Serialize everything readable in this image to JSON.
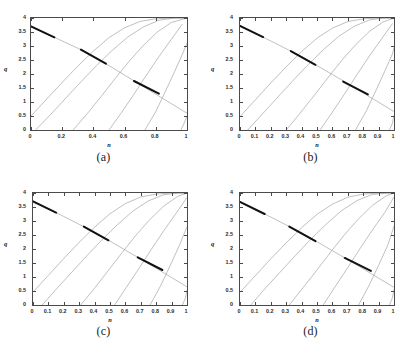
{
  "figure": {
    "background": "#ffffff",
    "panels": [
      {
        "caption": "(a)",
        "xlabel": "n",
        "ylabel": "q",
        "xticks": [
          "0",
          "0.2",
          "0.4",
          "0.6",
          "0.8",
          "1"
        ],
        "xtickvals": [
          0,
          0.2,
          0.4,
          0.6,
          0.8,
          1
        ],
        "yticks": [
          "0",
          "0.5",
          "1",
          "1.5",
          "2",
          "2.5",
          "3",
          "3.5",
          "4"
        ],
        "ytickvals": [
          0,
          0.5,
          1,
          1.5,
          2,
          2.5,
          3,
          3.5,
          4
        ]
      },
      {
        "caption": "(b)",
        "xlabel": "n",
        "ylabel": "q",
        "xticks": [
          "0",
          "0.1",
          "0.2",
          "0.3",
          "0.4",
          "0.5",
          "0.6",
          "0.7",
          "0.8",
          "0.9",
          "1"
        ],
        "xtickvals": [
          0,
          0.1,
          0.2,
          0.3,
          0.4,
          0.5,
          0.6,
          0.7,
          0.8,
          0.9,
          1
        ],
        "yticks": [
          "0",
          "0.5",
          "1",
          "1.5",
          "2",
          "2.5",
          "3",
          "3.5",
          "4"
        ],
        "ytickvals": [
          0,
          0.5,
          1,
          1.5,
          2,
          2.5,
          3,
          3.5,
          4
        ]
      },
      {
        "caption": "(c)",
        "xlabel": "n",
        "ylabel": "q",
        "xticks": [
          "0",
          "0.1",
          "0.2",
          "0.3",
          "0.4",
          "0.5",
          "0.6",
          "0.7",
          "0.8",
          "0.9",
          "1"
        ],
        "xtickvals": [
          0,
          0.1,
          0.2,
          0.3,
          0.4,
          0.5,
          0.6,
          0.7,
          0.8,
          0.9,
          1
        ],
        "yticks": [
          "0",
          "0.5",
          "1",
          "1.5",
          "2",
          "2.5",
          "3",
          "3.5",
          "4"
        ],
        "ytickvals": [
          0,
          0.5,
          1,
          1.5,
          2,
          2.5,
          3,
          3.5,
          4
        ]
      },
      {
        "caption": "(d)",
        "xlabel": "n",
        "ylabel": "q",
        "xticks": [
          "0",
          "0.1",
          "0.2",
          "0.3",
          "0.4",
          "0.5",
          "0.6",
          "0.7",
          "0.8",
          "0.9",
          "1"
        ],
        "xtickvals": [
          0,
          0.1,
          0.2,
          0.3,
          0.4,
          0.5,
          0.6,
          0.7,
          0.8,
          0.9,
          1
        ],
        "yticks": [
          "0",
          "0.5",
          "1",
          "1.5",
          "2",
          "2.5",
          "3",
          "3.5",
          "4"
        ],
        "ytickvals": [
          0,
          0.5,
          1,
          1.5,
          2,
          2.5,
          3,
          3.5,
          4
        ]
      }
    ],
    "showthrough": [
      "",
      "",
      "",
      ""
    ]
  },
  "chart_data": [
    {
      "type": "line",
      "panel": "(a)",
      "title": "",
      "xlabel": "n",
      "ylabel": "q",
      "xlim": [
        0,
        1
      ],
      "ylim": [
        0,
        4
      ],
      "grid": false,
      "legend": "none",
      "line_color": "#8c8c8c",
      "highlight_color": "#111111",
      "series": [
        {
          "name": "descending-branch",
          "comment": "main falling curve from upper-left to lower-right",
          "x": [
            0.0,
            0.05,
            0.1,
            0.15,
            0.2,
            0.25,
            0.3,
            0.35,
            0.4,
            0.45,
            0.5,
            0.55,
            0.6,
            0.65,
            0.7,
            0.75,
            0.8,
            0.85,
            0.9,
            0.95,
            1.0
          ],
          "y": [
            3.7,
            3.57,
            3.44,
            3.31,
            3.18,
            3.05,
            2.92,
            2.78,
            2.63,
            2.47,
            2.3,
            2.13,
            1.96,
            1.79,
            1.62,
            1.45,
            1.28,
            1.11,
            0.94,
            0.77,
            0.6
          ]
        },
        {
          "name": "ascending-family-1",
          "x": [
            0.0,
            0.1,
            0.2,
            0.3,
            0.4,
            0.5,
            0.6,
            0.7,
            0.8,
            0.9,
            1.0
          ],
          "y": [
            0.5,
            1.1,
            1.7,
            2.28,
            2.82,
            3.3,
            3.65,
            3.88,
            3.97,
            4.0,
            4.0
          ]
        },
        {
          "name": "ascending-family-2",
          "x": [
            0.03,
            0.12,
            0.22,
            0.32,
            0.42,
            0.52,
            0.62,
            0.72,
            0.82,
            0.92,
            1.0
          ],
          "y": [
            0.0,
            0.52,
            1.12,
            1.72,
            2.3,
            2.84,
            3.32,
            3.68,
            3.92,
            4.0,
            4.0
          ]
        },
        {
          "name": "ascending-family-3",
          "x": [
            0.27,
            0.36,
            0.45,
            0.54,
            0.63,
            0.72,
            0.81,
            0.9,
            1.0
          ],
          "y": [
            0.0,
            0.58,
            1.2,
            1.84,
            2.46,
            3.02,
            3.5,
            3.84,
            4.0
          ]
        },
        {
          "name": "ascending-family-4",
          "x": [
            0.5,
            0.58,
            0.66,
            0.74,
            0.82,
            0.9,
            0.97
          ],
          "y": [
            0.0,
            0.62,
            1.28,
            1.96,
            2.62,
            3.24,
            3.78
          ]
        },
        {
          "name": "ascending-family-5",
          "x": [
            0.73,
            0.8,
            0.86,
            0.92,
            0.97,
            1.0
          ],
          "y": [
            0.0,
            0.66,
            1.36,
            2.08,
            2.7,
            3.1
          ]
        },
        {
          "name": "ascending-family-6",
          "x": [
            0.96,
            0.98,
            1.0
          ],
          "y": [
            0.0,
            0.22,
            0.5
          ]
        },
        {
          "name": "highlight-segment-1",
          "comment": "thick black segment near upper left",
          "x": [
            0.0,
            0.15
          ],
          "y": [
            3.7,
            3.31
          ]
        },
        {
          "name": "highlight-segment-2",
          "comment": "thick black segment near middle",
          "x": [
            0.32,
            0.48
          ],
          "y": [
            2.87,
            2.37
          ]
        },
        {
          "name": "highlight-segment-3",
          "comment": "thick black segment lower right",
          "x": [
            0.66,
            0.82
          ],
          "y": [
            1.75,
            1.3
          ]
        }
      ]
    },
    {
      "type": "line",
      "panel": "(b)",
      "title": "",
      "xlabel": "n",
      "ylabel": "q",
      "xlim": [
        0,
        1
      ],
      "ylim": [
        0,
        4
      ],
      "grid": false,
      "legend": "none",
      "line_color": "#8c8c8c",
      "highlight_color": "#111111",
      "series": [
        {
          "name": "descending-branch",
          "x": [
            0.0,
            0.1,
            0.2,
            0.3,
            0.4,
            0.5,
            0.6,
            0.7,
            0.8,
            0.9,
            1.0
          ],
          "y": [
            3.72,
            3.45,
            3.18,
            2.9,
            2.62,
            2.3,
            1.98,
            1.66,
            1.32,
            0.99,
            0.66
          ]
        },
        {
          "name": "ascending-family-1",
          "x": [
            0.0,
            0.1,
            0.2,
            0.3,
            0.4,
            0.5,
            0.6,
            0.7,
            0.8,
            0.9,
            1.0
          ],
          "y": [
            0.48,
            1.08,
            1.68,
            2.26,
            2.8,
            3.28,
            3.64,
            3.87,
            3.97,
            4.0,
            4.0
          ]
        },
        {
          "name": "ascending-family-2",
          "x": [
            0.05,
            0.14,
            0.24,
            0.34,
            0.44,
            0.54,
            0.64,
            0.74,
            0.84,
            0.94,
            1.0
          ],
          "y": [
            0.0,
            0.54,
            1.14,
            1.74,
            2.32,
            2.86,
            3.34,
            3.7,
            3.93,
            4.0,
            4.0
          ]
        },
        {
          "name": "ascending-family-3",
          "x": [
            0.3,
            0.39,
            0.48,
            0.57,
            0.66,
            0.75,
            0.84,
            0.93,
            1.0
          ],
          "y": [
            0.0,
            0.6,
            1.22,
            1.86,
            2.48,
            3.04,
            3.52,
            3.86,
            4.0
          ]
        },
        {
          "name": "ascending-family-4",
          "x": [
            0.52,
            0.6,
            0.68,
            0.76,
            0.84,
            0.92,
            0.99
          ],
          "y": [
            0.0,
            0.64,
            1.3,
            1.98,
            2.64,
            3.26,
            3.8
          ]
        },
        {
          "name": "ascending-family-5",
          "x": [
            0.75,
            0.82,
            0.88,
            0.94,
            0.99,
            1.0
          ],
          "y": [
            0.0,
            0.68,
            1.38,
            2.1,
            2.72,
            2.95
          ]
        },
        {
          "name": "ascending-family-6",
          "x": [
            0.97,
            0.99,
            1.0
          ],
          "y": [
            0.0,
            0.24,
            0.52
          ]
        },
        {
          "name": "highlight-segment-1",
          "x": [
            0.0,
            0.15
          ],
          "y": [
            3.72,
            3.32
          ]
        },
        {
          "name": "highlight-segment-2",
          "x": [
            0.33,
            0.49
          ],
          "y": [
            2.82,
            2.33
          ]
        },
        {
          "name": "highlight-segment-3",
          "x": [
            0.67,
            0.83
          ],
          "y": [
            1.73,
            1.27
          ]
        }
      ]
    },
    {
      "type": "line",
      "panel": "(c)",
      "title": "",
      "xlabel": "n",
      "ylabel": "q",
      "xlim": [
        0,
        1
      ],
      "ylim": [
        0,
        4
      ],
      "grid": false,
      "legend": "none",
      "line_color": "#8c8c8c",
      "highlight_color": "#111111",
      "series": [
        {
          "name": "descending-branch",
          "x": [
            0.0,
            0.1,
            0.2,
            0.3,
            0.4,
            0.5,
            0.6,
            0.7,
            0.8,
            0.9,
            1.0
          ],
          "y": [
            3.7,
            3.43,
            3.16,
            2.88,
            2.6,
            2.28,
            1.96,
            1.64,
            1.31,
            0.98,
            0.65
          ]
        },
        {
          "name": "ascending-family-1",
          "x": [
            0.0,
            0.1,
            0.2,
            0.3,
            0.4,
            0.5,
            0.6,
            0.7,
            0.8,
            0.9,
            1.0
          ],
          "y": [
            0.46,
            1.06,
            1.66,
            2.24,
            2.78,
            3.26,
            3.62,
            3.86,
            3.96,
            4.0,
            4.0
          ]
        },
        {
          "name": "ascending-family-2",
          "x": [
            0.06,
            0.15,
            0.25,
            0.35,
            0.45,
            0.55,
            0.65,
            0.75,
            0.85,
            0.95,
            1.0
          ],
          "y": [
            0.0,
            0.56,
            1.16,
            1.76,
            2.34,
            2.88,
            3.36,
            3.72,
            3.94,
            4.0,
            4.0
          ]
        },
        {
          "name": "ascending-family-3",
          "x": [
            0.31,
            0.4,
            0.49,
            0.58,
            0.67,
            0.76,
            0.85,
            0.94,
            1.0
          ],
          "y": [
            0.0,
            0.6,
            1.24,
            1.88,
            2.5,
            3.06,
            3.54,
            3.88,
            4.0
          ]
        },
        {
          "name": "ascending-family-4",
          "x": [
            0.53,
            0.61,
            0.69,
            0.77,
            0.85,
            0.93,
            1.0
          ],
          "y": [
            0.0,
            0.66,
            1.32,
            2.0,
            2.66,
            3.28,
            3.84
          ]
        },
        {
          "name": "ascending-family-5",
          "x": [
            0.76,
            0.83,
            0.89,
            0.95,
            1.0
          ],
          "y": [
            0.0,
            0.7,
            1.4,
            2.12,
            2.8
          ]
        },
        {
          "name": "ascending-family-6",
          "x": [
            0.97,
            0.99,
            1.0
          ],
          "y": [
            0.0,
            0.25,
            0.54
          ]
        },
        {
          "name": "highlight-segment-1",
          "x": [
            0.0,
            0.15
          ],
          "y": [
            3.7,
            3.3
          ]
        },
        {
          "name": "highlight-segment-2",
          "x": [
            0.33,
            0.49
          ],
          "y": [
            2.8,
            2.31
          ]
        },
        {
          "name": "highlight-segment-3",
          "x": [
            0.68,
            0.84
          ],
          "y": [
            1.7,
            1.25
          ]
        }
      ]
    },
    {
      "type": "line",
      "panel": "(d)",
      "title": "",
      "xlabel": "n",
      "ylabel": "q",
      "xlim": [
        0,
        1
      ],
      "ylim": [
        0,
        4
      ],
      "grid": false,
      "legend": "none",
      "line_color": "#8c8c8c",
      "highlight_color": "#111111",
      "series": [
        {
          "name": "descending-branch",
          "x": [
            0.0,
            0.1,
            0.2,
            0.3,
            0.4,
            0.5,
            0.6,
            0.7,
            0.8,
            0.9,
            1.0
          ],
          "y": [
            3.68,
            3.41,
            3.14,
            2.86,
            2.58,
            2.26,
            1.94,
            1.62,
            1.29,
            0.96,
            0.63
          ]
        },
        {
          "name": "ascending-family-1",
          "x": [
            0.0,
            0.1,
            0.2,
            0.3,
            0.4,
            0.5,
            0.6,
            0.7,
            0.8,
            0.9,
            1.0
          ],
          "y": [
            0.45,
            1.05,
            1.65,
            2.22,
            2.76,
            3.24,
            3.6,
            3.85,
            3.96,
            4.0,
            4.0
          ]
        },
        {
          "name": "ascending-family-2",
          "x": [
            0.07,
            0.16,
            0.26,
            0.36,
            0.46,
            0.56,
            0.66,
            0.76,
            0.86,
            0.96,
            1.0
          ],
          "y": [
            0.0,
            0.57,
            1.17,
            1.77,
            2.35,
            2.89,
            3.37,
            3.73,
            3.95,
            4.0,
            4.0
          ]
        },
        {
          "name": "ascending-family-3",
          "x": [
            0.32,
            0.41,
            0.5,
            0.59,
            0.68,
            0.77,
            0.86,
            0.95,
            1.0
          ],
          "y": [
            0.0,
            0.62,
            1.25,
            1.9,
            2.52,
            3.08,
            3.56,
            3.9,
            4.0
          ]
        },
        {
          "name": "ascending-family-4",
          "x": [
            0.54,
            0.62,
            0.7,
            0.78,
            0.86,
            0.94,
            1.0
          ],
          "y": [
            0.0,
            0.67,
            1.34,
            2.02,
            2.68,
            3.3,
            3.86
          ]
        },
        {
          "name": "ascending-family-5",
          "x": [
            0.77,
            0.84,
            0.9,
            0.96,
            1.0
          ],
          "y": [
            0.0,
            0.72,
            1.42,
            2.14,
            2.82
          ]
        },
        {
          "name": "ascending-family-6",
          "x": [
            0.97,
            0.99,
            1.0
          ],
          "y": [
            0.0,
            0.26,
            0.56
          ]
        },
        {
          "name": "highlight-segment-1",
          "x": [
            0.0,
            0.16
          ],
          "y": [
            3.68,
            3.25
          ]
        },
        {
          "name": "highlight-segment-2",
          "x": [
            0.32,
            0.49
          ],
          "y": [
            2.8,
            2.28
          ]
        },
        {
          "name": "highlight-segment-3",
          "x": [
            0.68,
            0.85
          ],
          "y": [
            1.68,
            1.22
          ]
        }
      ]
    }
  ]
}
